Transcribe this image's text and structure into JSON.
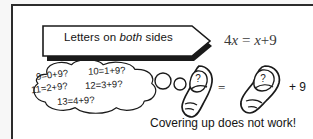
{
  "figure": {
    "background_color": "#f7f7f7",
    "frame_color": "#2c2c2c",
    "ink_color": "#141414"
  },
  "banner": {
    "text_before": "Letters on ",
    "text_emphasis": "both",
    "text_after": " sides",
    "full_text": "Letters on both sides"
  },
  "equation": {
    "left_coefficient": "4",
    "left_variable": "x",
    "equals": "=",
    "right_variable": "x",
    "plus": "+",
    "right_constant": "9",
    "full_text": "4x = x+9"
  },
  "thought_bubble": {
    "guesses": [
      "9=0+9?",
      "10=1+9?",
      "11=2+9?",
      "12=3+9?",
      "13=4+9?"
    ]
  },
  "covering_row": {
    "thumb_left_label": "?",
    "equals_sign": "=",
    "thumb_right_label": "?",
    "trailing_term": "+ 9"
  },
  "caption": {
    "text": "Covering up does not work!"
  }
}
